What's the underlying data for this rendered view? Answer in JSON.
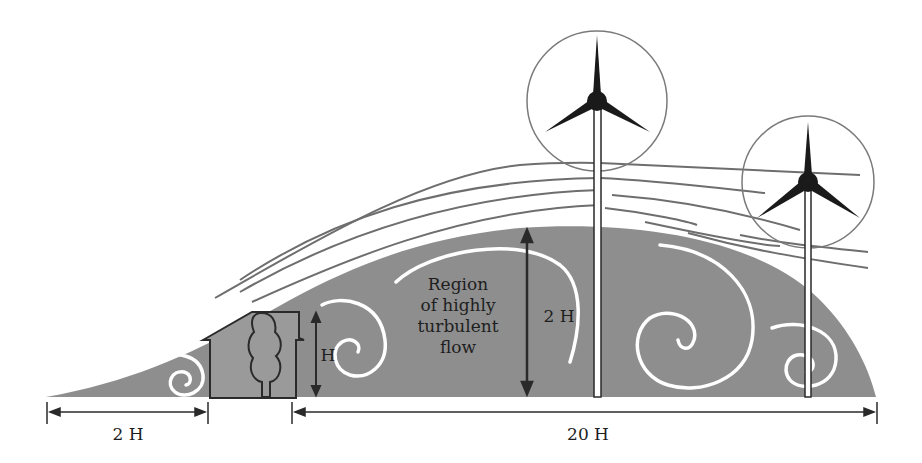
{
  "diagram": {
    "labels": {
      "region_line1": "Region",
      "region_line2": "of highly",
      "region_line3": "turbulent",
      "region_line4": "flow",
      "height_2h": "2 H",
      "obstacle_height": "H",
      "upwind_distance": "2 H",
      "downwind_distance": "20 H"
    },
    "elements": {
      "obstacle": "house-with-tree",
      "turbines": [
        "turbine-tall-center",
        "turbine-right"
      ],
      "turbulent_region": "gray dome with white swirl vortices",
      "streamlines": "gray flow lines above region"
    },
    "colors": {
      "region_fill": "#8c8c8c",
      "swirl": "#ffffff",
      "streamline": "#6e6e6e",
      "outline": "#2a2a2a",
      "background": "#ffffff"
    }
  }
}
